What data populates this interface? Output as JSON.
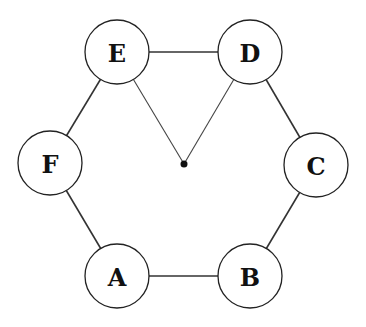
{
  "diagram": {
    "type": "graph",
    "nodes": [
      {
        "id": "A",
        "label": "A",
        "x": 117,
        "y": 276
      },
      {
        "id": "B",
        "label": "B",
        "x": 250,
        "y": 276
      },
      {
        "id": "C",
        "label": "C",
        "x": 316,
        "y": 165
      },
      {
        "id": "D",
        "label": "D",
        "x": 250,
        "y": 52
      },
      {
        "id": "E",
        "label": "E",
        "x": 117,
        "y": 52
      },
      {
        "id": "F",
        "label": "F",
        "x": 50,
        "y": 163
      }
    ],
    "node_radius": 32,
    "edges": [
      {
        "from": "A",
        "to": "B"
      },
      {
        "from": "B",
        "to": "C"
      },
      {
        "from": "C",
        "to": "D"
      },
      {
        "from": "D",
        "to": "E"
      },
      {
        "from": "E",
        "to": "F"
      },
      {
        "from": "F",
        "to": "A"
      }
    ],
    "center_point": {
      "x": 184,
      "y": 164
    },
    "spokes": [
      {
        "from": "E",
        "to": "center"
      },
      {
        "from": "D",
        "to": "center"
      }
    ],
    "colors": {
      "stroke": "#222222",
      "fill": "#ffffff",
      "dot": "#111111"
    }
  }
}
